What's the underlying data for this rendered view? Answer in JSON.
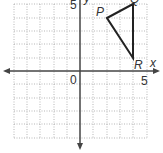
{
  "graph": {
    "x_axis_label": "x",
    "y_axis_label": "y",
    "origin_label": "0",
    "x_tick_label": "5",
    "y_tick_label": "5",
    "grid_range": {
      "x": [
        -4,
        5
      ],
      "y": [
        -5,
        5
      ]
    }
  },
  "triangle": {
    "vertices": [
      {
        "name": "P",
        "x": 2,
        "y": 4
      },
      {
        "name": "Q",
        "x": 4,
        "y": 5
      },
      {
        "name": "R",
        "x": 4,
        "y": 1
      }
    ]
  }
}
